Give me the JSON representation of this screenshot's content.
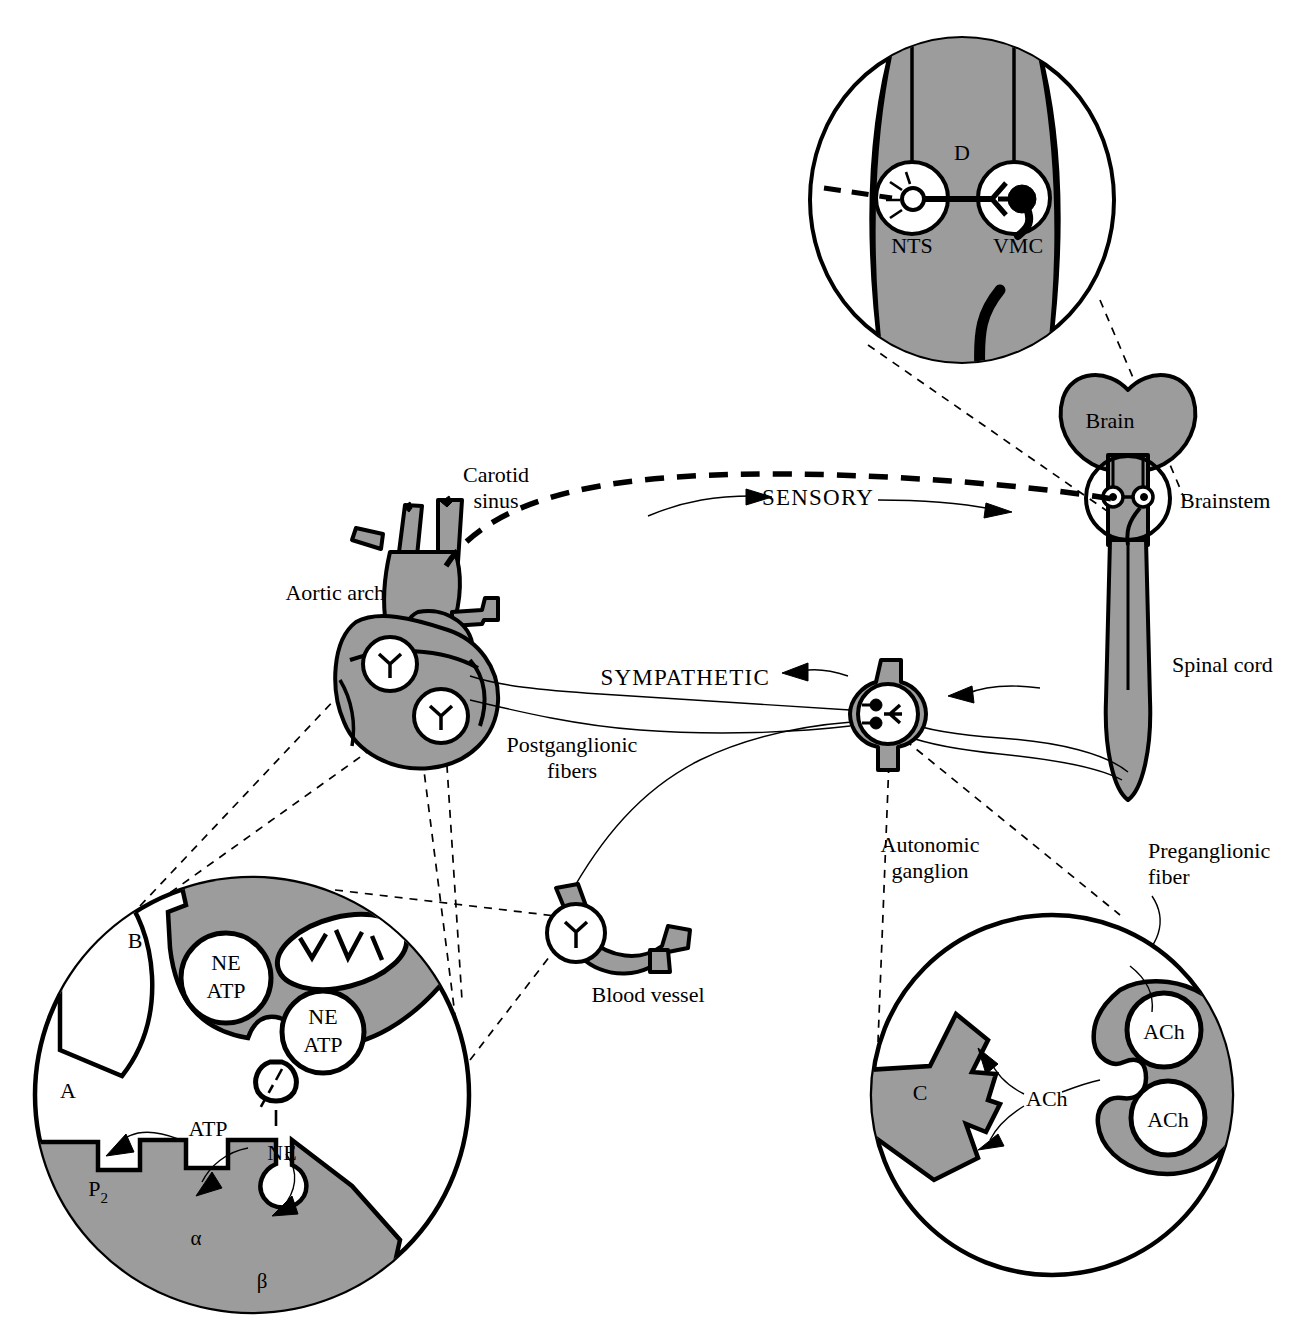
{
  "figure": {
    "background_color": "#ffffff",
    "tissue_gray": "#9c9c9c",
    "ink_color": "#000000"
  },
  "labels": {
    "brain": "Brain",
    "brainstem": "Brainstem",
    "spinal_cord": "Spinal cord",
    "carotid_sinus": "Carotid sinus",
    "carotid_sinus_line1": "Carotid",
    "carotid_sinus_line2": "sinus",
    "aortic_arch": "Aortic arch",
    "sensory": "SENSORY",
    "sympathetic": "SYMPATHETIC",
    "postganglionic_line1": "Postganglionic",
    "postganglionic_line2": "fibers",
    "preganglionic_line1": "Preganglionic",
    "preganglionic_line2": "fiber",
    "autonomic_ganglion_line1": "Autonomic",
    "autonomic_ganglion_line2": "ganglion",
    "blood_vessel": "Blood vessel"
  },
  "insets": {
    "brainstem_detail": {
      "panel_letter": "D",
      "nucleus_left": "NTS",
      "nucleus_right": "VMC"
    },
    "sympathetic_neuroeffector": {
      "panel_letter_presynaptic": "B",
      "panel_letter_postsynaptic": "A",
      "vesicles": [
        {
          "line1": "NE",
          "line2": "ATP"
        },
        {
          "line1": "NE",
          "line2": "ATP"
        }
      ],
      "transmitter_atp": "ATP",
      "transmitter_ne": "NE",
      "receptors": [
        "P",
        "α",
        "β"
      ],
      "receptor_p_subscript": "2",
      "organelle": "mitochondrion"
    },
    "ganglionic_synapse": {
      "panel_letter": "C",
      "vesicles": [
        "ACh",
        "ACh"
      ],
      "transmitter": "ACh"
    }
  },
  "arrows": {
    "sensory_direction": "afferent toward brainstem",
    "sympathetic_direction": "efferent toward heart"
  }
}
